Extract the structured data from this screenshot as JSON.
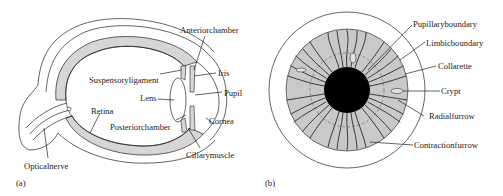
{
  "figure": {
    "panels": [
      {
        "id": "a",
        "tag": "(a)",
        "subject": "eye cross-section",
        "labels": {
          "anterior_chamber": "Anteriorchamber",
          "iris": "Iris",
          "suspensory_ligament": "Suspensoryligament",
          "pupil": "Pupil",
          "lens": "Lens",
          "retina": "Retina",
          "cornea": "Cornea",
          "posterior_chamber": "Posteriorchamber",
          "ciliary_muscle": "Ciliarymuscle",
          "optical_nerve": "Opticalnerve"
        }
      },
      {
        "id": "b",
        "tag": "(b)",
        "subject": "iris front view",
        "labels": {
          "pupillary_boundary": "Pupillaryboundary",
          "limbic_boundary": "Limbicboundary",
          "collarette": "Collarette",
          "crypt": "Crypt",
          "radial_furrow": "Radialfurrow",
          "contraction_furrow": "Contractionfurrow"
        }
      }
    ],
    "colors": {
      "outline": "#222222",
      "shade": "#d6d6d6",
      "pupil": "#000000",
      "iris_fill": "#c9c9c9",
      "background": "#ffffff"
    }
  }
}
